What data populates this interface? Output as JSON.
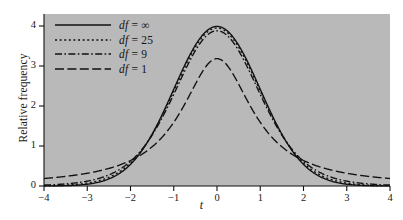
{
  "figure": {
    "background_color": "#b9b9b9",
    "page_color": "#ffffff",
    "line_color": "#111111"
  },
  "axes": {
    "x_title": "t",
    "y_title": "Relative frequency",
    "x_ticks": [
      "-4",
      "-3",
      "-2",
      "-1",
      "0",
      "1",
      "2",
      "3",
      "4"
    ],
    "y_ticks": [
      "0",
      "1",
      "2",
      "3",
      "4"
    ]
  },
  "legend": {
    "items": [
      {
        "label_prefix": "df",
        "label_suffix": " = ∞",
        "style": "solid",
        "dash": "none"
      },
      {
        "label_prefix": "df",
        "label_suffix": " = 25",
        "style": "dotted",
        "dash": "2,2.6"
      },
      {
        "label_prefix": "df",
        "label_suffix": " = 9",
        "style": "dashdot",
        "dash": "7,2.4,1.6,2.4"
      },
      {
        "label_prefix": "df",
        "label_suffix": " = 1",
        "style": "longdash",
        "dash": "9,3.4"
      }
    ]
  },
  "chart_data": {
    "type": "line",
    "title": "",
    "subtitle": "",
    "xlabel": "t",
    "ylabel": "Relative frequency",
    "xlim": [
      -4,
      4
    ],
    "ylim": [
      0,
      4.3
    ],
    "grid": false,
    "legend_position": "top-left",
    "y_display_scale": "density × 10",
    "note": "Student's t probability density functions scaled by 10 so peaks read near 4 on the axis",
    "x": [
      -4,
      -3.75,
      -3.5,
      -3.25,
      -3,
      -2.75,
      -2.5,
      -2.25,
      -2,
      -1.75,
      -1.5,
      -1.25,
      -1,
      -0.75,
      -0.5,
      -0.25,
      0,
      0.25,
      0.5,
      0.75,
      1,
      1.25,
      1.5,
      1.75,
      2,
      2.25,
      2.5,
      2.75,
      3,
      3.25,
      3.5,
      3.75,
      4
    ],
    "series": [
      {
        "name": "df = ∞",
        "dash": "none",
        "peak": 3.99,
        "values": [
          0.01,
          0.02,
          0.09,
          0.2,
          0.44,
          0.91,
          1.75,
          3.1,
          5.4,
          8.63,
          12.95,
          18.26,
          24.2,
          30.11,
          35.21,
          38.67,
          39.89,
          38.67,
          35.21,
          30.11,
          24.2,
          18.26,
          12.95,
          8.63,
          5.4,
          3.1,
          1.75,
          0.91,
          0.44,
          0.2,
          0.09,
          0.02,
          0.01
        ],
        "values_display": [
          0.001,
          0.002,
          0.009,
          0.02,
          0.044,
          0.091,
          0.175,
          0.31,
          0.54,
          0.863,
          1.295,
          1.826,
          2.42,
          3.011,
          3.521,
          3.867,
          3.989,
          3.867,
          3.521,
          3.011,
          2.42,
          1.826,
          1.295,
          0.863,
          0.54,
          0.31,
          0.175,
          0.091,
          0.044,
          0.02,
          0.009,
          0.002,
          0.001
        ]
      },
      {
        "name": "df = 25",
        "dash": "2,2.6",
        "peak": 3.93,
        "values_display": [
          0.07,
          0.1,
          0.14,
          0.22,
          0.34,
          0.53,
          0.84,
          1.35,
          2.16,
          3.4,
          5.21,
          7.68,
          10.8,
          14.42,
          18.14,
          21.4,
          23.5,
          21.4,
          18.14,
          14.42,
          10.8,
          7.68,
          5.21,
          3.4,
          2.16,
          1.35,
          0.84,
          0.53,
          0.34,
          0.22,
          0.14,
          0.1,
          0.07
        ]
      },
      {
        "name": "df = 9",
        "dash": "7,2.4,1.6,2.4",
        "peak": 3.8,
        "values_display": [
          0.16,
          0.21,
          0.28,
          0.39,
          0.55,
          0.79,
          1.15,
          1.71,
          2.56,
          3.86,
          5.75,
          8.32,
          11.6,
          15.3,
          18.9,
          21.8,
          23.4,
          21.8,
          18.9,
          15.3,
          11.6,
          8.32,
          5.75,
          3.86,
          2.56,
          1.71,
          1.15,
          0.79,
          0.55,
          0.39,
          0.28,
          0.21,
          0.16
        ]
      },
      {
        "name": "df = 1",
        "dash": "9,3.4",
        "peak": 3.18,
        "values_display": [
          0.47,
          0.53,
          0.61,
          0.71,
          0.84,
          1.0,
          1.21,
          1.49,
          1.87,
          2.37,
          3.06,
          3.99,
          5.2,
          6.67,
          8.26,
          9.67,
          10.32,
          9.67,
          8.26,
          6.67,
          5.2,
          3.99,
          3.06,
          2.37,
          1.87,
          1.49,
          1.21,
          1.0,
          0.84,
          0.71,
          0.61,
          0.53,
          0.47
        ]
      }
    ]
  },
  "geometry": {
    "plot_left": 44,
    "plot_right": 390,
    "plot_top": 14,
    "plot_bottom": 186,
    "x_min": -4,
    "x_max": 4,
    "y_min": 0,
    "y_max": 4.3
  }
}
